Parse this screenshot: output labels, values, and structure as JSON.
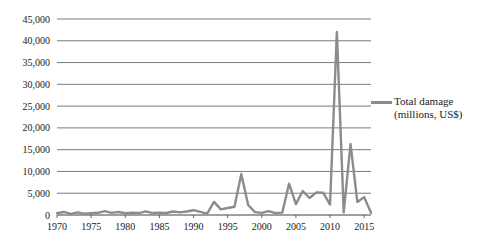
{
  "chart_data": {
    "type": "line",
    "title": "",
    "xlabel": "",
    "ylabel": "",
    "x": [
      1970,
      1971,
      1972,
      1973,
      1974,
      1975,
      1976,
      1977,
      1978,
      1979,
      1980,
      1981,
      1982,
      1983,
      1984,
      1985,
      1986,
      1987,
      1988,
      1989,
      1990,
      1991,
      1992,
      1993,
      1994,
      1995,
      1996,
      1997,
      1998,
      1999,
      2000,
      2001,
      2002,
      2003,
      2004,
      2005,
      2006,
      2007,
      2008,
      2009,
      2010,
      2011,
      2012,
      2013,
      2014,
      2015,
      2016
    ],
    "series": [
      {
        "name": "Total damage (millions, US$)",
        "values": [
          400,
          700,
          250,
          600,
          300,
          400,
          500,
          900,
          500,
          700,
          400,
          500,
          450,
          850,
          450,
          500,
          450,
          800,
          600,
          800,
          1100,
          700,
          300,
          3000,
          1300,
          1600,
          1900,
          9400,
          2300,
          650,
          500,
          900,
          450,
          550,
          7200,
          2500,
          5500,
          3900,
          5200,
          5100,
          2400,
          42000,
          600,
          16300,
          3000,
          4100,
          500
        ]
      }
    ],
    "ylim": [
      0,
      45000
    ],
    "ytick_step": 5000,
    "xticks": [
      1970,
      1975,
      1980,
      1985,
      1990,
      1995,
      2000,
      2005,
      2010,
      2015
    ],
    "grid": true,
    "legend_position": "right",
    "legend": {
      "line1": "Total damage",
      "line2": "(millions, US$)"
    },
    "colors": {
      "line": "#8c8c8c",
      "grid": "#595959",
      "axis": "#404040",
      "text": "#1a1a1a",
      "background": "#ffffff"
    }
  }
}
